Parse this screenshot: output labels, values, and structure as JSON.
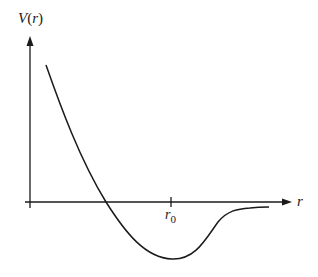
{
  "diagram": {
    "y_axis_label": "V(r)",
    "y_axis_label_parts": {
      "name": "V",
      "open": "(",
      "var": "r",
      "close": ")"
    },
    "x_axis_label": "r",
    "tick_label": {
      "base": "r",
      "subscript": "0"
    },
    "colors": {
      "line": "#1a1a1a",
      "background": "#ffffff"
    }
  }
}
